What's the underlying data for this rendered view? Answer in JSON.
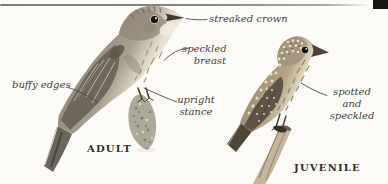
{
  "colors": {
    "background": "#fcfbf7",
    "rule_color": "#858583",
    "corner_mark_color": "#161616",
    "annotation_color": "#45413a",
    "caption_color": "#322e27"
  },
  "annotations": {
    "streaked_crown": "streaked crown",
    "speckled_breast": {
      "line1": "speckled",
      "line2": "breast"
    },
    "buffy_edges": "buffy edges",
    "upright_stance": {
      "line1": "upright",
      "line2": "stance"
    },
    "spotted_and_speckled": {
      "line1": "spotted and",
      "line2": "speckled"
    }
  },
  "captions": {
    "adult": "ADULT",
    "juvenile": "JUVENILE"
  }
}
